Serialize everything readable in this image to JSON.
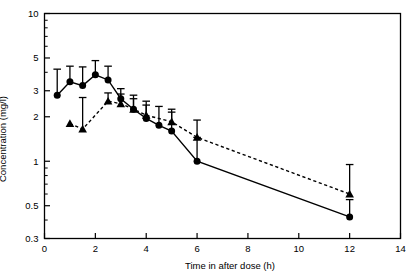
{
  "chart_data": {
    "type": "line",
    "title": "",
    "xlabel": "Time in after dose (h)",
    "ylabel": "Concentration (mg/l)",
    "yscale": "log",
    "ylim": [
      0.3,
      10
    ],
    "xlim": [
      0,
      14
    ],
    "xticks": [
      0,
      2,
      4,
      6,
      8,
      10,
      12,
      14
    ],
    "xticklabels": [
      "0",
      "2",
      "4",
      "6",
      "8",
      "10",
      "12",
      "14"
    ],
    "yticks": [
      0.3,
      0.5,
      1,
      2,
      3,
      5,
      10
    ],
    "yticklabels": [
      "0.3",
      "0.5",
      "1",
      "2",
      "3",
      "5",
      "10"
    ],
    "grid": false,
    "legend": "none",
    "series": [
      {
        "name": "filled-circle-solid-line",
        "marker": "circle",
        "linestyle": "solid",
        "color": "#000000",
        "x": [
          0.5,
          1.0,
          1.5,
          2.0,
          2.5,
          3.0,
          3.5,
          4.0,
          4.5,
          5.0,
          6.0,
          12.0
        ],
        "y": [
          2.8,
          3.45,
          3.25,
          3.85,
          3.55,
          2.65,
          2.25,
          1.95,
          1.75,
          1.6,
          1.0,
          0.42
        ],
        "err_hi": [
          4.2,
          4.4,
          4.35,
          4.8,
          4.4,
          3.1,
          2.8,
          2.55,
          2.35,
          2.15,
          1.45,
          0.55
        ],
        "err_lo": [
          2.8,
          3.45,
          3.25,
          3.85,
          3.55,
          2.65,
          2.25,
          1.95,
          1.75,
          1.6,
          1.0,
          0.42
        ]
      },
      {
        "name": "filled-triangle-dashed-line",
        "marker": "triangle",
        "linestyle": "dashed",
        "color": "#000000",
        "x": [
          1.0,
          1.5,
          2.5,
          3.0,
          3.5,
          4.0,
          5.0,
          6.0,
          12.0
        ],
        "y": [
          1.8,
          1.65,
          2.55,
          2.45,
          2.25,
          2.05,
          1.85,
          1.45,
          0.6
        ],
        "err_hi": [
          1.8,
          2.7,
          2.9,
          2.85,
          2.65,
          2.4,
          2.25,
          1.9,
          0.95
        ],
        "err_lo": [
          1.8,
          1.65,
          2.55,
          2.45,
          2.25,
          2.05,
          1.85,
          1.45,
          0.6
        ]
      }
    ]
  }
}
